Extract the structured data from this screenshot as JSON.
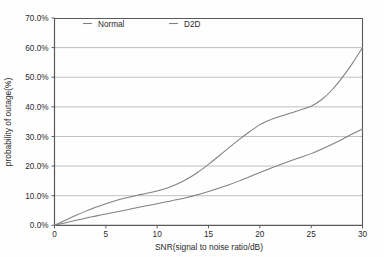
{
  "chart_data": {
    "type": "line",
    "title": "",
    "xlabel": "SNR(signal to noise ratio/dB)",
    "ylabel": "probability of outage(%)",
    "xlim": [
      0,
      30
    ],
    "ylim": [
      0,
      70
    ],
    "grid": true,
    "grid_axis": "y",
    "legend_position": "top-center-inside",
    "x_ticks": [
      0,
      5,
      10,
      15,
      20,
      25,
      30
    ],
    "x_tick_labels": [
      "0",
      "5",
      "10",
      "15",
      "20",
      "25",
      "30"
    ],
    "y_ticks": [
      0,
      10,
      20,
      30,
      40,
      50,
      60,
      70
    ],
    "y_tick_labels": [
      "0.0%",
      "10.0%",
      "20.0%",
      "30.0%",
      "40.0%",
      "50.0%",
      "60.0%",
      "70.0%"
    ],
    "x": [
      0,
      1,
      2,
      3,
      4,
      5,
      6,
      7,
      8,
      9,
      10,
      11,
      12,
      13,
      14,
      15,
      16,
      17,
      18,
      19,
      20,
      21,
      22,
      23,
      24,
      25,
      26,
      27,
      28,
      29,
      30
    ],
    "series": [
      {
        "name": "Normal",
        "color": "#808080",
        "values": [
          0.0,
          1.6,
          3.2,
          4.7,
          6.1,
          7.3,
          8.4,
          9.3,
          10.1,
          10.8,
          11.6,
          12.6,
          14.0,
          15.8,
          18.0,
          20.6,
          23.4,
          26.2,
          29.0,
          31.6,
          34.0,
          35.6,
          36.8,
          37.9,
          39.0,
          40.2,
          42.4,
          45.6,
          49.8,
          54.6,
          60.0
        ]
      },
      {
        "name": "D2D",
        "color": "#808080",
        "values": [
          0.0,
          0.8,
          1.6,
          2.4,
          3.1,
          3.8,
          4.5,
          5.2,
          5.9,
          6.6,
          7.3,
          8.0,
          8.7,
          9.5,
          10.4,
          11.4,
          12.5,
          13.7,
          15.0,
          16.4,
          17.8,
          19.2,
          20.5,
          21.8,
          23.0,
          24.2,
          25.7,
          27.3,
          29.0,
          30.8,
          32.5
        ]
      }
    ]
  },
  "legend": {
    "entries": [
      {
        "label": "Normal"
      },
      {
        "label": "D2D"
      }
    ]
  },
  "axis_titles": {
    "x": "SNR(signal to noise ratio/dB)",
    "y": "probability of outage(%)"
  }
}
